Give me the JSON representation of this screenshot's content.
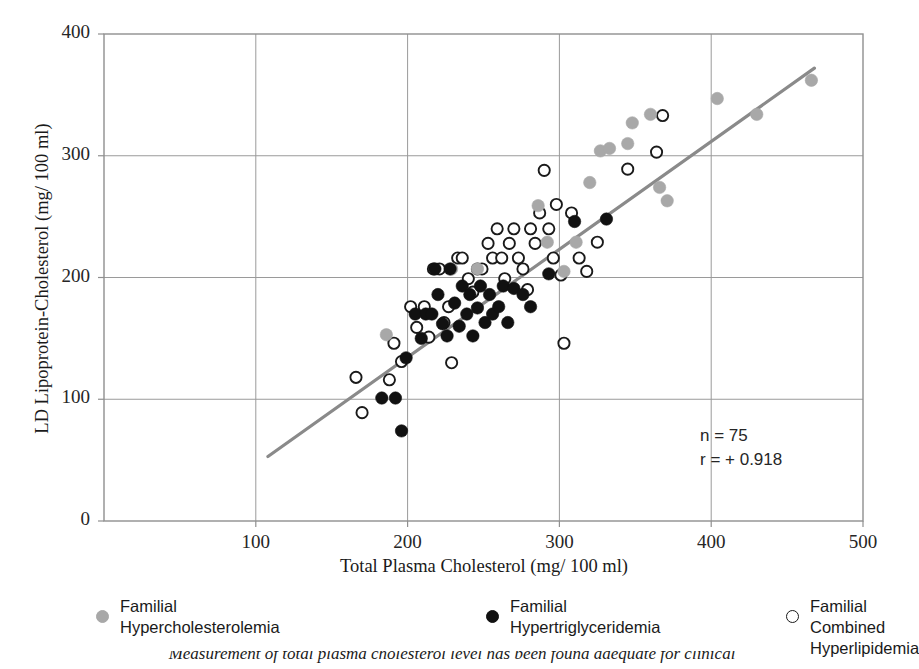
{
  "chart_data": {
    "type": "scatter",
    "title": "",
    "xlabel": "Total Plasma Cholesterol (mg/ 100 ml)",
    "ylabel": "LD Lipoprotein-Cholesterol (mg/ 100 ml)",
    "xlim": [
      0,
      500
    ],
    "ylim": [
      0,
      400
    ],
    "xticks": [
      100,
      200,
      300,
      400,
      500
    ],
    "yticks": [
      0,
      100,
      200,
      300,
      400
    ],
    "grid": true,
    "legend_position": "below-axes",
    "annotations": {
      "n_label": "n = 75",
      "r_label": "r = + 0.918"
    },
    "trendline": {
      "type": "linear-fit",
      "color": "#8a8a8a",
      "x_start": 108,
      "y_start": 53,
      "x_end": 468,
      "y_end": 372
    },
    "series": [
      {
        "name": "Familial Hypercholesterolemia",
        "marker": "filled-circle",
        "color": "#a8a8a8",
        "points": [
          [
            186,
            153
          ],
          [
            229,
            207
          ],
          [
            246,
            207
          ],
          [
            286,
            259
          ],
          [
            292,
            229
          ],
          [
            303,
            205
          ],
          [
            311,
            229
          ],
          [
            320,
            278
          ],
          [
            327,
            304
          ],
          [
            333,
            306
          ],
          [
            345,
            310
          ],
          [
            348,
            327
          ],
          [
            360,
            334
          ],
          [
            366,
            274
          ],
          [
            371,
            263
          ],
          [
            404,
            347
          ],
          [
            430,
            334
          ],
          [
            466,
            362
          ]
        ]
      },
      {
        "name": "Familial Hypertriglyceridemia",
        "marker": "filled-circle",
        "color": "#111111",
        "points": [
          [
            183,
            101
          ],
          [
            192,
            101
          ],
          [
            196,
            74
          ],
          [
            199,
            134
          ],
          [
            205,
            170
          ],
          [
            209,
            150
          ],
          [
            212,
            170
          ],
          [
            216,
            170
          ],
          [
            218,
            207
          ],
          [
            220,
            186
          ],
          [
            223,
            162
          ],
          [
            226,
            152
          ],
          [
            228,
            207
          ],
          [
            231,
            179
          ],
          [
            234,
            160
          ],
          [
            236,
            193
          ],
          [
            239,
            170
          ],
          [
            241,
            186
          ],
          [
            243,
            152
          ],
          [
            246,
            175
          ],
          [
            248,
            193
          ],
          [
            251,
            163
          ],
          [
            254,
            186
          ],
          [
            256,
            170
          ],
          [
            260,
            176
          ],
          [
            263,
            193
          ],
          [
            266,
            163
          ],
          [
            270,
            191
          ],
          [
            276,
            186
          ],
          [
            281,
            176
          ],
          [
            293,
            203
          ],
          [
            310,
            246
          ],
          [
            331,
            248
          ]
        ]
      },
      {
        "name": "Familial Combined Hyperlipidemia",
        "marker": "open-circle",
        "color": "#1a1a1a",
        "points": [
          [
            166,
            118
          ],
          [
            170,
            89
          ],
          [
            188,
            116
          ],
          [
            191,
            146
          ],
          [
            196,
            131
          ],
          [
            202,
            176
          ],
          [
            206,
            159
          ],
          [
            211,
            176
          ],
          [
            214,
            151
          ],
          [
            217,
            207
          ],
          [
            221,
            207
          ],
          [
            224,
            163
          ],
          [
            227,
            176
          ],
          [
            229,
            130
          ],
          [
            233,
            216
          ],
          [
            236,
            216
          ],
          [
            240,
            199
          ],
          [
            243,
            188
          ],
          [
            246,
            207
          ],
          [
            249,
            207
          ],
          [
            253,
            228
          ],
          [
            256,
            216
          ],
          [
            259,
            240
          ],
          [
            262,
            216
          ],
          [
            264,
            199
          ],
          [
            267,
            228
          ],
          [
            270,
            240
          ],
          [
            273,
            216
          ],
          [
            276,
            207
          ],
          [
            279,
            190
          ],
          [
            281,
            240
          ],
          [
            284,
            228
          ],
          [
            287,
            253
          ],
          [
            290,
            288
          ],
          [
            293,
            240
          ],
          [
            296,
            216
          ],
          [
            298,
            260
          ],
          [
            301,
            202
          ],
          [
            303,
            146
          ],
          [
            308,
            253
          ],
          [
            313,
            216
          ],
          [
            318,
            205
          ],
          [
            325,
            229
          ],
          [
            345,
            289
          ],
          [
            364,
            303
          ],
          [
            368,
            333
          ]
        ]
      }
    ]
  },
  "annotation": {
    "n": "n = 75",
    "r": "r = + 0.918"
  },
  "axes": {
    "x": {
      "title": "Total Plasma Cholesterol (mg/ 100 ml)",
      "ticks": [
        "100",
        "200",
        "300",
        "400",
        "500"
      ]
    },
    "y": {
      "title": "LD Lipoprotein-Cholesterol (mg/ 100 ml)",
      "ticks": [
        "400",
        "300",
        "200",
        "100",
        "0"
      ]
    }
  },
  "legend": {
    "items": [
      {
        "label": "Familial\nHypercholesterolemia",
        "marker": "gray-filled-circle"
      },
      {
        "label": "Familial\nHypertriglyceridemia",
        "marker": "black-filled-circle"
      },
      {
        "label": "Familial Combined\nHyperlipidemia",
        "marker": "open-circle"
      }
    ]
  },
  "caption": {
    "text": "Measurement of total plasma cholesterol level has been found adequate for clinical"
  }
}
